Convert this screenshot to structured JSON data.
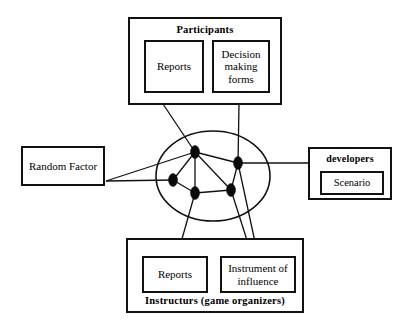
{
  "diagram": {
    "type": "network-relationship-diagram",
    "background_color": "#ffffff",
    "line_color": "#111111",
    "node_color": "#0a0a0a"
  },
  "participants": {
    "title": "Participants",
    "items": [
      {
        "label": "Reports"
      },
      {
        "label": "Decision making forms"
      }
    ]
  },
  "random_factor": {
    "label": "Random Factor"
  },
  "developers": {
    "title": "developers",
    "items": [
      {
        "label": "Scenario"
      }
    ]
  },
  "instructors": {
    "title": "Instructurs (game organizers)",
    "items": [
      {
        "label": "Reports"
      },
      {
        "label": "Instrument of influence"
      }
    ]
  },
  "network": {
    "ellipse": {
      "cx": 213,
      "cy": 176,
      "rx": 57,
      "ry": 45
    },
    "nodes": [
      {
        "id": "n-top",
        "cx": 195,
        "cy": 152,
        "rx": 4.5,
        "ry": 6.5
      },
      {
        "id": "n-right",
        "cx": 238,
        "cy": 163,
        "rx": 4.5,
        "ry": 6.5
      },
      {
        "id": "n-left",
        "cx": 173,
        "cy": 180,
        "rx": 4.5,
        "ry": 6.5
      },
      {
        "id": "n-bottom-left",
        "cx": 195,
        "cy": 193,
        "rx": 4.5,
        "ry": 6.5
      },
      {
        "id": "n-bottom-right",
        "cx": 231,
        "cy": 190,
        "rx": 4.5,
        "ry": 6.5
      }
    ],
    "internal_edges": [
      {
        "from": "n-top",
        "to": "n-right"
      },
      {
        "from": "n-top",
        "to": "n-left"
      },
      {
        "from": "n-top",
        "to": "n-bottom-left"
      },
      {
        "from": "n-top",
        "to": "n-bottom-right"
      },
      {
        "from": "n-left",
        "to": "n-bottom-left"
      },
      {
        "from": "n-bottom-left",
        "to": "n-bottom-right"
      },
      {
        "from": "n-right",
        "to": "n-bottom-right"
      }
    ],
    "external_edges": [
      {
        "from": "participants-reports",
        "to": "n-top",
        "x1": 163,
        "y1": 104,
        "x2": 195,
        "y2": 152
      },
      {
        "from": "participants-decision",
        "to": "n-right",
        "x1": 239,
        "y1": 104,
        "x2": 238,
        "y2": 163
      },
      {
        "from": "random-factor",
        "to": "n-top",
        "x1": 106,
        "y1": 181,
        "x2": 195,
        "y2": 152
      },
      {
        "from": "random-factor",
        "to": "n-left",
        "x1": 106,
        "y1": 181,
        "x2": 173,
        "y2": 180
      },
      {
        "from": "n-right",
        "to": "developers",
        "x1": 238,
        "y1": 163,
        "x2": 308,
        "y2": 163
      },
      {
        "from": "n-bottom-left",
        "to": "instructors-reports",
        "x1": 195,
        "y1": 193,
        "x2": 178,
        "y2": 253
      },
      {
        "from": "n-right",
        "to": "instructors-instrument",
        "x1": 238,
        "y1": 163,
        "x2": 258,
        "y2": 256
      },
      {
        "from": "n-bottom-right",
        "to": "instructors-instrument",
        "x1": 231,
        "y1": 190,
        "x2": 252,
        "y2": 256
      }
    ]
  }
}
